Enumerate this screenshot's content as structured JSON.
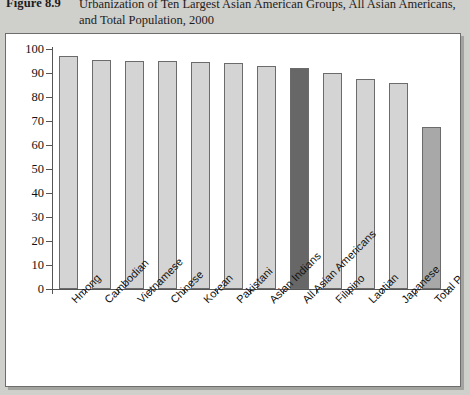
{
  "figure": {
    "number": "Figure 8.9",
    "caption": "Urbanization of Ten Largest Asian American Groups, All Asian Americans, and Total Population, 2000"
  },
  "chart_data": {
    "type": "bar",
    "title": "Urbanization of Ten Largest Asian American Groups, All Asian Americans, and Total Population, 2000",
    "xlabel": "",
    "ylabel": "",
    "ylim": [
      0,
      100
    ],
    "ytick_step": 10,
    "yticks": [
      "0",
      "10",
      "20",
      "30",
      "40",
      "50",
      "60",
      "70",
      "80",
      "90",
      "100"
    ],
    "grid": false,
    "legend": "none",
    "categories": [
      "Hmong",
      "Cambodian",
      "Vietnamese",
      "Chinese",
      "Korean",
      "Pakistani",
      "Asian Indians",
      "All Asian Americans",
      "Filipino",
      "Laotian",
      "Japanese",
      "Total Population"
    ],
    "values": [
      97,
      95.5,
      95,
      95,
      94.5,
      94,
      93,
      92,
      90,
      87.5,
      86,
      67.5
    ],
    "bar_colors": [
      "#d4d4d4",
      "#d4d4d4",
      "#d4d4d4",
      "#d4d4d4",
      "#d4d4d4",
      "#d4d4d4",
      "#d4d4d4",
      "#676767",
      "#d4d4d4",
      "#d4d4d4",
      "#d4d4d4",
      "#a8a8a8"
    ],
    "highlighted_category": "All Asian Americans"
  },
  "colors": {
    "page_background": "#cfcfcb",
    "panel_background": "#ffffff",
    "panel_border": "#6d6d6d",
    "bar_default": "#d4d4d4",
    "bar_highlight": "#676767",
    "bar_total": "#a8a8a8",
    "bar_outline": "#6b6b6b",
    "axis": "#555555",
    "text": "#1c1c1c"
  }
}
